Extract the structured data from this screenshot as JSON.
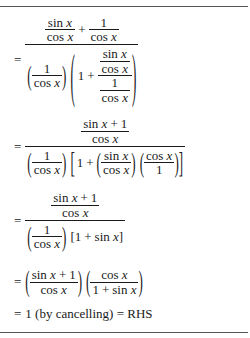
{
  "document": {
    "type": "math-derivation",
    "steps": [
      {
        "id": "step-1",
        "relation": "=",
        "latex": "\\frac{\\frac{\\sin x}{\\cos x}+\\frac{1}{\\cos x}}{\\left(\\frac{1}{\\cos x}\\right)\\left(1+\\frac{\\frac{\\sin x}{\\cos x}}{\\frac{1}{\\cos x}}\\right)}",
        "parts": {
          "sin": "sin",
          "cos": "cos",
          "x": "x",
          "one": "1",
          "plus": "+"
        }
      },
      {
        "id": "step-2",
        "relation": "=",
        "latex": "\\frac{\\frac{\\sin x+1}{\\cos x}}{\\left(\\frac{1}{\\cos x}\\right)\\left[1+\\left(\\frac{\\sin x}{\\cos x}\\right)\\left(\\frac{\\cos x}{1}\\right)\\right]}"
      },
      {
        "id": "step-3",
        "relation": "=",
        "latex": "\\frac{\\frac{\\sin x+1}{\\cos x}}{\\left(\\frac{1}{\\cos x}\\right)[1+\\sin x]}",
        "bracket_text": "[1 + sin x]"
      },
      {
        "id": "step-4",
        "relation": "=",
        "latex": "\\left(\\frac{\\sin x+1}{\\cos x}\\right)\\left(\\frac{\\cos x}{1+\\sin x}\\right)"
      },
      {
        "id": "step-5",
        "relation": "=",
        "text": "1 (by cancelling) = RHS"
      }
    ]
  },
  "t": {
    "eq": "=",
    "plus": "+",
    "one": "1",
    "sin": "sin",
    "cos": "cos",
    "x": "x",
    "lparen": "(",
    "rparen": ")",
    "lbrack": "[",
    "rbrack": "]",
    "final": "1 (by cancelling) = RHS"
  }
}
